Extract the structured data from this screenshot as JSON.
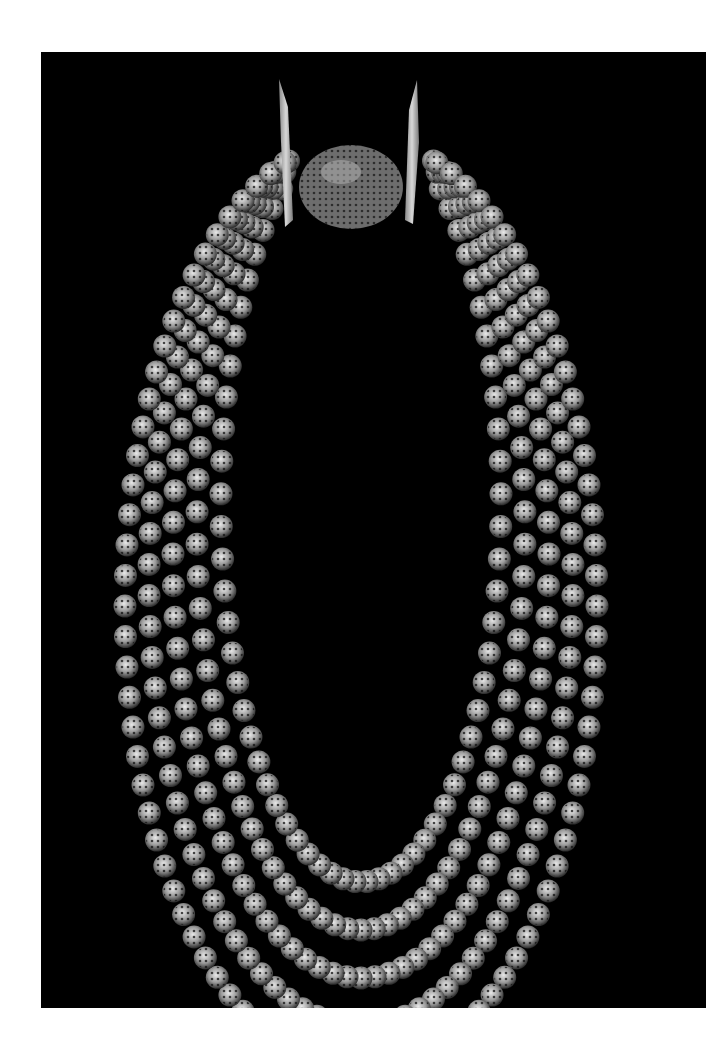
{
  "image": {
    "description": "Multi-strand silver filigree bead necklace with ornate box clasp, photographed on black background",
    "background_color": "#000000",
    "border_color": "#ffffff",
    "subject": "necklace"
  },
  "necklace": {
    "strands": 5,
    "bead_style": "openwork filigree sphere",
    "bead_color": "#cfcfcf",
    "clasp": "filigree box clasp with two pointed end bars"
  }
}
